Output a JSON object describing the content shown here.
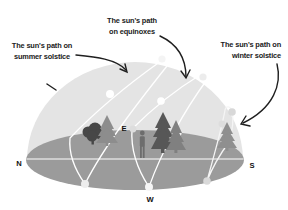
{
  "diagram": {
    "title_labels": {
      "summer": {
        "line1": "The sun's path on",
        "line2": "summer solstice"
      },
      "equinox": {
        "line1": "The sun's path",
        "line2": "on equinoxes"
      },
      "winter": {
        "line1": "The sun's path on",
        "line2": "winter solstice"
      }
    },
    "compass": {
      "north": "N",
      "east": "E",
      "south": "S",
      "west": "W"
    },
    "colors": {
      "dome": "#e4e4e4",
      "ground": "#9b9b9b",
      "sun_path": "#ffffff",
      "annotation": "#1f1f1f"
    }
  }
}
